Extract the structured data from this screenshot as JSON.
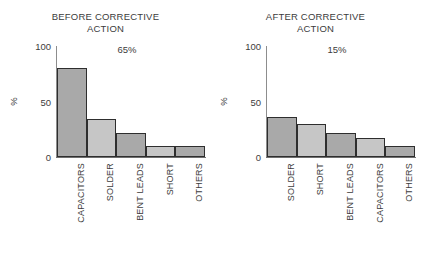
{
  "figure": {
    "background": "#ffffff",
    "axis_color": "#6f6f6f",
    "text_color": "#3c3c3c",
    "bar_edge_color": "#2e2e2e",
    "color_dark": "#a9a9a9",
    "color_light": "#c6c6c6"
  },
  "chart_data": [
    {
      "type": "bar",
      "id": "before-corrective-action",
      "title": "BEFORE CORRECTIVE\nACTION",
      "annotation": "65%",
      "xlabel": "",
      "ylabel": "%",
      "ylim": [
        0,
        100
      ],
      "yticks": [
        0,
        50,
        100
      ],
      "ytick_labels": [
        "0",
        "50",
        "100"
      ],
      "grid": false,
      "legend": false,
      "categories": [
        "CAPACITORS",
        "SOLDER",
        "BENT LEADS",
        "SHORT",
        "OTHERS"
      ],
      "values": [
        80,
        34,
        22,
        10,
        10
      ],
      "bar_colors": [
        "#a9a9a9",
        "#c6c6c6",
        "#a9a9a9",
        "#c6c6c6",
        "#a9a9a9"
      ]
    },
    {
      "type": "bar",
      "id": "after-corrective-action",
      "title": "AFTER CORRECTIVE\nACTION",
      "annotation": "15%",
      "xlabel": "",
      "ylabel": "%",
      "ylim": [
        0,
        100
      ],
      "yticks": [
        0,
        50,
        100
      ],
      "ytick_labels": [
        "0",
        "50",
        "100"
      ],
      "grid": false,
      "legend": false,
      "categories": [
        "SOLDER",
        "SHORT",
        "BENT LEADS",
        "CAPACITORS",
        "OTHERS"
      ],
      "values": [
        36,
        30,
        22,
        17,
        10
      ],
      "bar_colors": [
        "#a9a9a9",
        "#c6c6c6",
        "#a9a9a9",
        "#c6c6c6",
        "#a9a9a9"
      ]
    }
  ]
}
